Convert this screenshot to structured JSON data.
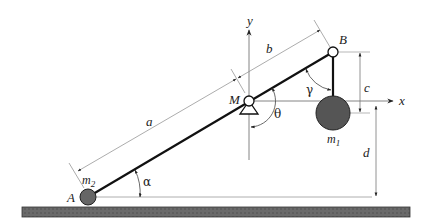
{
  "diagram": {
    "type": "mechanism",
    "colors": {
      "line": "#111111",
      "thin_line": "#777777",
      "mass_fill": "#555555",
      "ground_fill": "#6a6a6a",
      "ground_border": "#333333"
    },
    "points": {
      "A": "A",
      "B": "B",
      "M": "M"
    },
    "masses": {
      "m1_base": "m",
      "m1_sub": "1",
      "m2_base": "m",
      "m2_sub": "2"
    },
    "axes": {
      "x": "x",
      "y": "y"
    },
    "lengths": {
      "a": "a",
      "b": "b",
      "c": "c",
      "d": "d"
    },
    "angles": {
      "alpha": "α",
      "theta": "θ",
      "gamma": "γ"
    }
  }
}
